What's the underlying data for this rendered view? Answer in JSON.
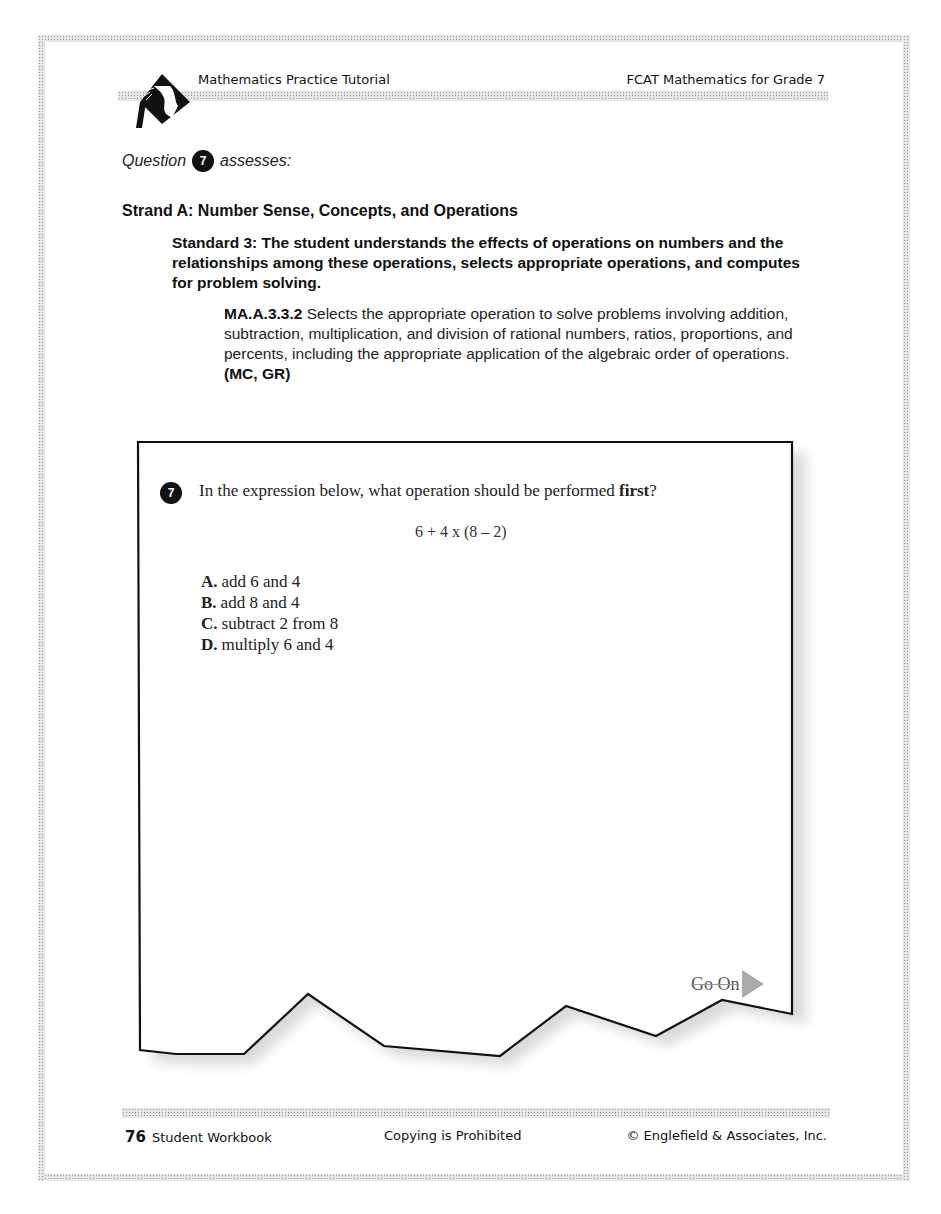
{
  "header": {
    "left_title": "Mathematics Practice Tutorial",
    "right_title": "FCAT Mathematics for Grade 7",
    "logo_icon": "diamond-silhouette-logo"
  },
  "assessment": {
    "prefix": "Question",
    "question_number": "7",
    "suffix": "assesses:"
  },
  "strand": {
    "title": "Strand A: Number Sense, Concepts, and Operations"
  },
  "standard": {
    "text": "Standard 3: The student understands the effects of operations on numbers and the relationships among these operations, selects appropriate operations, and computes for problem solving."
  },
  "benchmark": {
    "code": "MA.A.3.3.2",
    "text": " Selects the appropriate operation to solve problems involving addition, subtraction, multiplication, and division of rational numbers, ratios, proportions, and percents, including the appropriate application of the algebraic order of operations. ",
    "formats": "(MC, GR)"
  },
  "question": {
    "number": "7",
    "prompt_start": "In the expression below, what operation should be performed ",
    "prompt_bold": "first",
    "prompt_end": "?",
    "expression": "6 + 4 x (8 – 2)",
    "options": [
      {
        "letter": "A.",
        "text": "add 6 and 4"
      },
      {
        "letter": "B.",
        "text": "add 8 and 4"
      },
      {
        "letter": "C.",
        "text": "subtract 2 from 8"
      },
      {
        "letter": "D.",
        "text": "multiply 6 and 4"
      }
    ],
    "go_on_label": "Go On",
    "go_on_icon": "right-arrow-icon"
  },
  "footer": {
    "page_number": "76",
    "left_label": "Student Workbook",
    "center_label": "Copying is Prohibited",
    "right_label": "© Englefield & Associates, Inc."
  }
}
